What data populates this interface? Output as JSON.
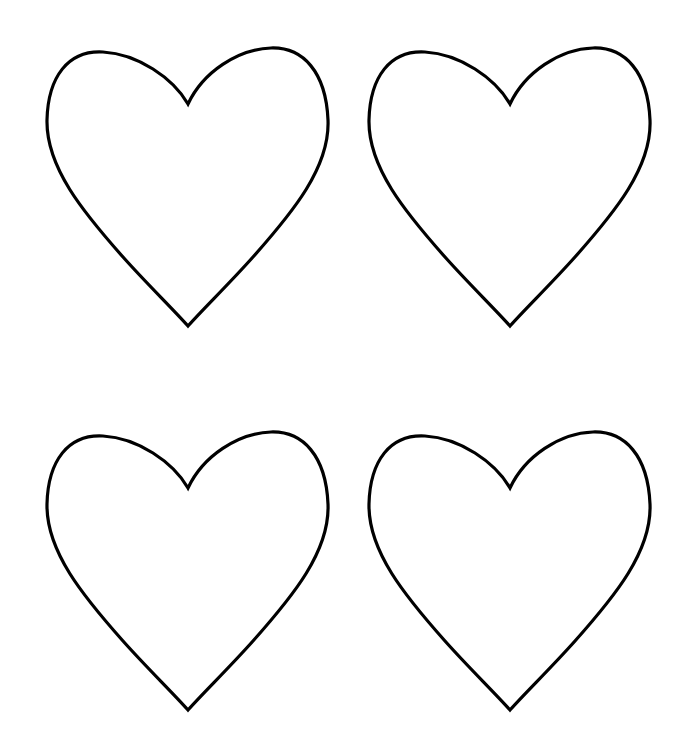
{
  "page": {
    "background": "#ffffff"
  },
  "hearts": [
    {
      "id": "top-left",
      "x": 43,
      "y": 42,
      "stroke": "#000000"
    },
    {
      "id": "top-right",
      "x": 365,
      "y": 42,
      "stroke": "#000000"
    },
    {
      "id": "bottom-left",
      "x": 43,
      "y": 426,
      "stroke": "#000000"
    },
    {
      "id": "bottom-right",
      "x": 365,
      "y": 426,
      "stroke": "#000000"
    }
  ]
}
